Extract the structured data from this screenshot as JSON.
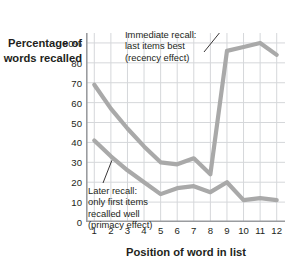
{
  "chart_data": {
    "type": "line",
    "title": "",
    "xlabel": "Position of word in list",
    "ylabel": "Percentage\nof words\nrecalled",
    "x": [
      1,
      2,
      3,
      4,
      5,
      6,
      7,
      8,
      9,
      10,
      11,
      12
    ],
    "xtick_labels": [
      "1",
      "2",
      "3",
      "4",
      "5",
      "6",
      "7",
      "8",
      "9",
      "10",
      "11",
      "12"
    ],
    "ytick_labels": [
      "0",
      "10",
      "20",
      "30",
      "40",
      "50",
      "60",
      "70",
      "80",
      "90%"
    ],
    "ytick_values": [
      0,
      10,
      20,
      30,
      40,
      50,
      60,
      70,
      80,
      90
    ],
    "ylim": [
      0,
      95
    ],
    "xlim": [
      0.5,
      12.5
    ],
    "grid": true,
    "legend": "none",
    "series": [
      {
        "name": "Immediate recall",
        "color": "#a9a9a9",
        "values": [
          69,
          57,
          47,
          38,
          30,
          29,
          32,
          24,
          86,
          88,
          90,
          84
        ]
      },
      {
        "name": "Later recall",
        "color": "#a9a9a9",
        "values": [
          41,
          33,
          26,
          20,
          14,
          17,
          18,
          15,
          20,
          11,
          12,
          11
        ]
      }
    ],
    "annotations": [
      {
        "id": "immediate-recall-note",
        "text": "Immediate recall:\nlast items best\n(recency effect)",
        "target_point": 9
      },
      {
        "id": "later-recall-note",
        "text": "Later recall:\nonly first items\nrecalled well\n(primacy effect)",
        "target_point": 2
      }
    ]
  },
  "axes": {
    "y_title": "Percentage\nof words\nrecalled",
    "x_title": "Position of word in list"
  },
  "colors": {
    "line": "#a9a9a9",
    "grid": "#d5d7da",
    "axis": "#9a9c9f",
    "text": "#231f20"
  }
}
